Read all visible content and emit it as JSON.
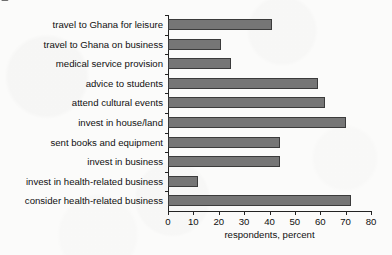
{
  "figure": {
    "cropped_title": "a case with Ghana"
  },
  "chart_data": {
    "type": "bar",
    "orientation": "horizontal",
    "title": "",
    "xlabel": "respondents, percent",
    "ylabel": "",
    "xlim": [
      0,
      80
    ],
    "xticks": [
      0,
      10,
      20,
      30,
      40,
      50,
      60,
      70,
      80
    ],
    "grid": false,
    "legend": null,
    "categories": [
      "travel to Ghana for leisure",
      "travel to Ghana on business",
      "medical service provision",
      "advice to students",
      "attend cultural events",
      "invest in house/land",
      "sent books and equipment",
      "invest in business",
      "invest in health-related business",
      "consider health-related business"
    ],
    "values": [
      41,
      21,
      25,
      59,
      62,
      70,
      44,
      44,
      12,
      72
    ],
    "bar_color": "#767676",
    "bar_edge_color": "#3b3b3b"
  }
}
